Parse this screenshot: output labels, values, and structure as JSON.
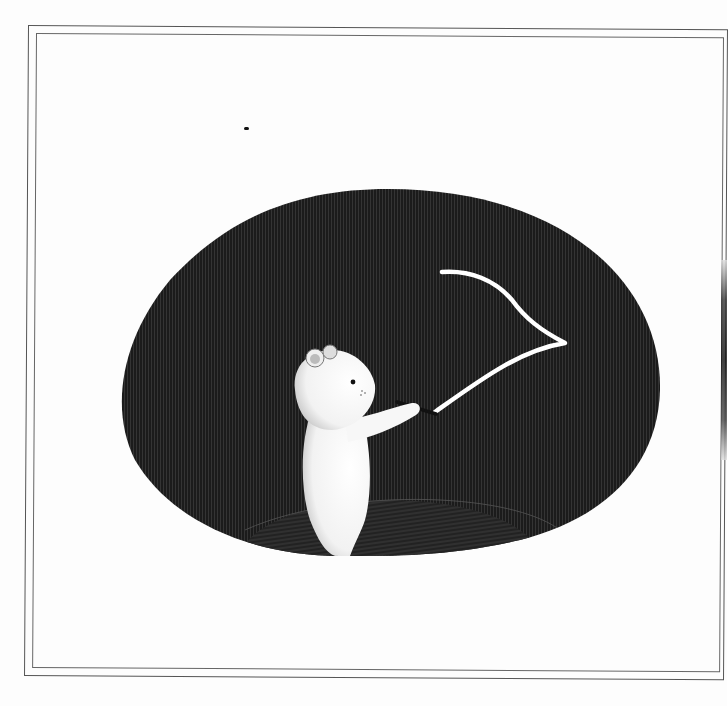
{
  "illustration": {
    "description": "White bear holding a glowing wand, drawing a white line across a dark oval night scene",
    "colors": {
      "paper": "#fdfdfd",
      "frame": "#555555",
      "oval_fill": "#1a1a1a",
      "ground_fill": "#2a2a2a",
      "bear": "#ffffff",
      "light_line": "#ffffff"
    }
  }
}
